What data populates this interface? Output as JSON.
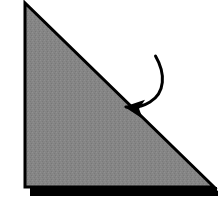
{
  "figure": {
    "background_color": "#ffffff",
    "canvas": {
      "width": 219,
      "height": 212
    }
  },
  "shapes": {
    "triangle": {
      "name": "right-triangle",
      "fill_color": "#858585",
      "outline_color": "#000000",
      "outline_width": 3,
      "vertices": [
        {
          "label": "top-apex",
          "x": 25,
          "y": 3
        },
        {
          "label": "bottom-left",
          "x": 25,
          "y": 187
        },
        {
          "label": "bottom-right",
          "x": 214,
          "y": 187
        }
      ]
    },
    "shadow": {
      "name": "drop-shadow",
      "fill_color": "#000000",
      "offset_x": 6,
      "offset_y": 7,
      "vertices": [
        {
          "x": 29,
          "y": 188
        },
        {
          "x": 216,
          "y": 188
        },
        {
          "x": 216,
          "y": 196
        },
        {
          "x": 29,
          "y": 196
        }
      ]
    },
    "arrow": {
      "name": "fold-direction-arrow",
      "color": "#000000",
      "stroke_width": 3,
      "curve_start": {
        "x": 155,
        "y": 56
      },
      "curve_end": {
        "x": 124,
        "y": 107
      },
      "tip": {
        "x": 100,
        "y": 113
      },
      "direction": "counterclockwise-to-lower-left"
    }
  },
  "labels": {
    "figure_caption": "",
    "step_number": ""
  },
  "colors": {
    "paper_gray": "#858585",
    "ink_black": "#000000",
    "page_white": "#ffffff"
  }
}
